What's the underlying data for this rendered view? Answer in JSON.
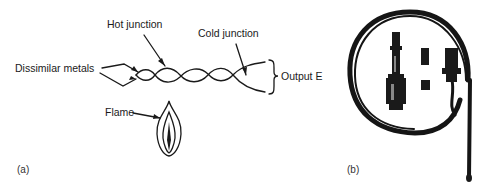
{
  "figure": {
    "panel_a": {
      "label": "(a)",
      "annotations": {
        "hot_junction": "Hot junction",
        "cold_junction": "Cold junction",
        "dissimilar_metals": "Dissimilar metals",
        "output": "Output E",
        "flame": "Flame"
      }
    },
    "panel_b": {
      "label": "(b)",
      "description": "Photograph of a thermocouple assembly with coiled lead, connector fittings and probe tip"
    },
    "colors": {
      "ink": "#1a1a1a",
      "background": "#ffffff"
    }
  }
}
